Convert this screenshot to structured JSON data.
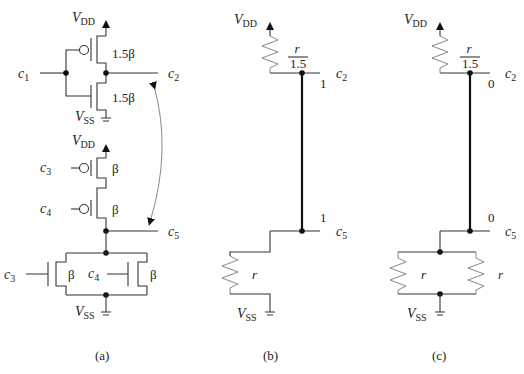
{
  "figure": {
    "panels": [
      {
        "id": "a",
        "caption": "(a)",
        "supply_top": "V",
        "supply_top_sub": "DD",
        "supply_bottom": "V",
        "supply_bottom_sub": "SS",
        "inverter": {
          "input": "c",
          "input_sub": "1",
          "output": "c",
          "output_sub": "2",
          "pmos_size": "1.5β",
          "nmos_size": "1.5β"
        },
        "nor_gate": {
          "supply_top": "V",
          "supply_top_sub": "DD",
          "pmos": [
            {
              "input": "c",
              "input_sub": "3",
              "size": "β"
            },
            {
              "input": "c",
              "input_sub": "4",
              "size": "β"
            }
          ],
          "nmos": [
            {
              "input": "c",
              "input_sub": "3",
              "size": "β"
            },
            {
              "input": "c",
              "input_sub": "4",
              "size": "β"
            }
          ],
          "output": "c",
          "output_sub": "5",
          "supply_bottom": "V",
          "supply_bottom_sub": "SS"
        },
        "coupling_arrow": "c2 ↔ c5"
      },
      {
        "id": "b",
        "caption": "(b)",
        "supply_top": "V",
        "supply_top_sub": "DD",
        "top_resistor": {
          "num": "r",
          "den": "1.5"
        },
        "node_top": {
          "label": "c",
          "sub": "2",
          "value": "1"
        },
        "node_bottom": {
          "label": "c",
          "sub": "5",
          "value": "1"
        },
        "bottom_resistor": "r",
        "supply_bottom": "V",
        "supply_bottom_sub": "SS"
      },
      {
        "id": "c",
        "caption": "(c)",
        "supply_top": "V",
        "supply_top_sub": "DD",
        "top_resistor": {
          "num": "r",
          "den": "1.5"
        },
        "node_top": {
          "label": "c",
          "sub": "2",
          "value": "0"
        },
        "node_bottom": {
          "label": "c",
          "sub": "5",
          "value": "0"
        },
        "bottom_resistors": [
          "r",
          "r"
        ],
        "supply_bottom": "V",
        "supply_bottom_sub": "SS"
      }
    ]
  }
}
